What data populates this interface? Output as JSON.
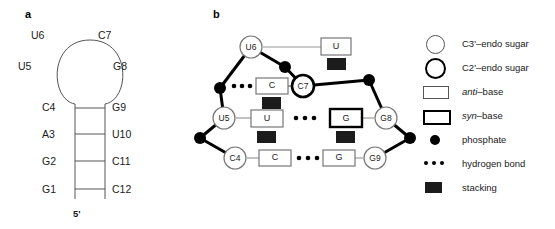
{
  "figure": {
    "panels": [
      {
        "label": "a",
        "name": "secondary-structure-panel"
      },
      {
        "label": "b",
        "name": "tertiary-conformation-panel"
      }
    ]
  },
  "panel_a": {
    "label": "a",
    "five_prime_label": "5'",
    "loop_residues": [
      {
        "id": "U6",
        "x": 40,
        "y": 33
      },
      {
        "id": "C7",
        "x": 98,
        "y": 33
      },
      {
        "id": "U5",
        "x": 24,
        "y": 66
      },
      {
        "id": "G8",
        "x": 113,
        "y": 66
      }
    ],
    "stem_residues_left": [
      {
        "id": "C4",
        "y": 101
      },
      {
        "id": "A3",
        "y": 129
      },
      {
        "id": "G2",
        "y": 157
      },
      {
        "id": "G1",
        "y": 185
      }
    ],
    "stem_residues_right": [
      {
        "id": "G9",
        "y": 101
      },
      {
        "id": "U10",
        "y": 129
      },
      {
        "id": "C11",
        "y": 157
      },
      {
        "id": "C12",
        "y": 185
      }
    ],
    "base_pairs": [
      "C4-G9",
      "A3-U10",
      "G2-C11",
      "G1-C12"
    ]
  },
  "panel_b": {
    "label": "b",
    "sugars": [
      {
        "id": "U6",
        "pucker": "C3'-endo",
        "x": 251,
        "y": 47
      },
      {
        "id": "C7",
        "pucker": "C2'-endo",
        "x": 303,
        "y": 86
      },
      {
        "id": "U5",
        "pucker": "C3'-endo",
        "x": 224,
        "y": 118
      },
      {
        "id": "G8",
        "pucker": "C3'-endo",
        "x": 386,
        "y": 118
      },
      {
        "id": "C4",
        "pucker": "C3'-endo",
        "x": 235,
        "y": 158
      },
      {
        "id": "G9",
        "pucker": "C3'-endo",
        "x": 375,
        "y": 158
      }
    ],
    "bases": [
      {
        "text": "U",
        "conformation": "anti",
        "x": 336,
        "y": 47,
        "attached_to": "U6"
      },
      {
        "text": "C",
        "conformation": "anti",
        "x": 272,
        "y": 86,
        "attached_to": "C7"
      },
      {
        "text": "U",
        "conformation": "anti",
        "x": 266,
        "y": 118,
        "attached_to": "U5"
      },
      {
        "text": "G",
        "conformation": "syn",
        "x": 345,
        "y": 118,
        "attached_to": "G8"
      },
      {
        "text": "C",
        "conformation": "anti",
        "x": 274,
        "y": 158,
        "attached_to": "C4"
      },
      {
        "text": "G",
        "conformation": "anti",
        "x": 338,
        "y": 158,
        "attached_to": "G9"
      }
    ],
    "hydrogen_bonds": [
      {
        "between": "C-phosphate-left",
        "y": 86
      },
      {
        "between": "U-G",
        "y": 118
      },
      {
        "between": "C-G",
        "y": 158
      }
    ],
    "stacking_marks": [
      {
        "x": 336,
        "y": 64
      },
      {
        "x": 272,
        "y": 102
      },
      {
        "x": 266,
        "y": 136
      },
      {
        "x": 345,
        "y": 136
      }
    ]
  },
  "legend": {
    "items": [
      {
        "glyph": "thin-circle-icon",
        "label": "C3'–endo sugar"
      },
      {
        "glyph": "thick-circle-icon",
        "label": "C2'–endo sugar"
      },
      {
        "glyph": "thin-box-icon",
        "label_html": "anti–base",
        "label": "anti–base"
      },
      {
        "glyph": "thick-box-icon",
        "label_html": "syn–base",
        "label": "syn–base"
      },
      {
        "glyph": "filled-dot-icon",
        "label": "phosphate"
      },
      {
        "glyph": "dotted-line-icon",
        "label": "hydrogen bond"
      },
      {
        "glyph": "filled-square-icon",
        "label": "stacking"
      }
    ]
  },
  "colors": {
    "ink": "#1a1a1a",
    "line": "#555555",
    "bold_line": "#000000",
    "fill": "#ffffff"
  }
}
